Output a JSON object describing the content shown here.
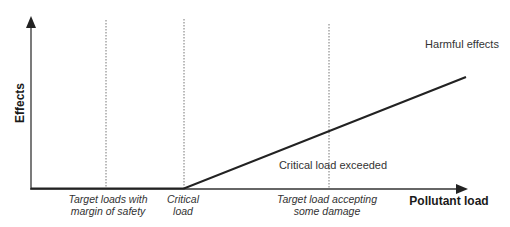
{
  "diagram": {
    "type": "critical-load-concept",
    "axes": {
      "x_label": "Pollutant load",
      "y_label": "Effects"
    },
    "markers": [
      {
        "id": "target-safety",
        "lines": [
          "Target loads with",
          "margin of safety"
        ]
      },
      {
        "id": "critical",
        "lines": [
          "Critical",
          "load"
        ]
      },
      {
        "id": "target-damage",
        "lines": [
          "Target load accepting",
          "some damage"
        ]
      }
    ],
    "annotations": {
      "harmful": "Harmful effects",
      "exceeded": "Critical load exceeded"
    },
    "colors": {
      "axis": "#333333",
      "curve": "#222222",
      "guide": "#777777"
    }
  }
}
